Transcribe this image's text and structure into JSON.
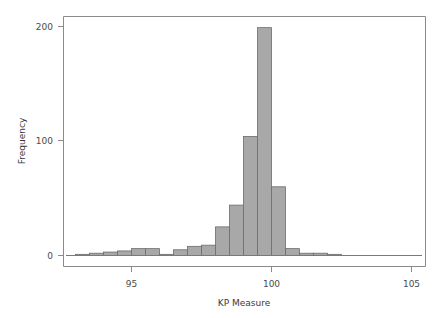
{
  "chart_data": {
    "type": "bar",
    "title": "",
    "subtitle": "",
    "xlabel": "KP Measure",
    "ylabel": "Frequency",
    "xlim": [
      93.0,
      105.5
    ],
    "ylim": [
      0,
      210
    ],
    "xticks": [
      95,
      100,
      105
    ],
    "xtick_labels": [
      "95",
      "100",
      "105"
    ],
    "yticks": [
      0,
      100,
      200
    ],
    "ytick_labels": [
      "0",
      "100",
      "200"
    ],
    "grid": false,
    "legend": null,
    "bin_width": 0.5,
    "bar_color": "#a8a8a8",
    "bar_edge_color": "#6b6b6b",
    "axis_color": "#8a8a8a",
    "text_color": "#4a4a4a",
    "background": "#ffffff",
    "categories": [
      "93.25",
      "93.75",
      "94.25",
      "94.75",
      "95.25",
      "95.75",
      "96.25",
      "96.75",
      "97.25",
      "97.75",
      "98.25",
      "98.75",
      "99.25",
      "99.75",
      "100.25",
      "100.75",
      "101.25",
      "101.75",
      "102.25",
      "102.75"
    ],
    "bins": [
      {
        "x0": 93.0,
        "x1": 93.5,
        "center": 93.25,
        "count": 1
      },
      {
        "x0": 93.5,
        "x1": 94.0,
        "center": 93.75,
        "count": 2
      },
      {
        "x0": 94.0,
        "x1": 94.5,
        "center": 94.25,
        "count": 3
      },
      {
        "x0": 94.5,
        "x1": 95.0,
        "center": 94.75,
        "count": 4
      },
      {
        "x0": 95.0,
        "x1": 95.5,
        "center": 95.25,
        "count": 6
      },
      {
        "x0": 95.5,
        "x1": 96.0,
        "center": 95.75,
        "count": 6
      },
      {
        "x0": 96.0,
        "x1": 96.5,
        "center": 96.25,
        "count": 1
      },
      {
        "x0": 96.5,
        "x1": 97.0,
        "center": 96.75,
        "count": 5
      },
      {
        "x0": 97.0,
        "x1": 97.5,
        "center": 97.25,
        "count": 8
      },
      {
        "x0": 97.5,
        "x1": 98.0,
        "center": 97.75,
        "count": 9
      },
      {
        "x0": 98.0,
        "x1": 98.5,
        "center": 98.25,
        "count": 25
      },
      {
        "x0": 98.5,
        "x1": 99.0,
        "center": 98.75,
        "count": 44
      },
      {
        "x0": 99.0,
        "x1": 99.5,
        "center": 99.25,
        "count": 104
      },
      {
        "x0": 99.5,
        "x1": 100.0,
        "center": 99.75,
        "count": 199
      },
      {
        "x0": 100.0,
        "x1": 100.5,
        "center": 100.25,
        "count": 60
      },
      {
        "x0": 100.5,
        "x1": 101.0,
        "center": 100.75,
        "count": 6
      },
      {
        "x0": 101.0,
        "x1": 101.5,
        "center": 101.25,
        "count": 2
      },
      {
        "x0": 101.5,
        "x1": 102.0,
        "center": 101.75,
        "count": 2
      },
      {
        "x0": 102.0,
        "x1": 102.5,
        "center": 102.25,
        "count": 1
      },
      {
        "x0": 102.5,
        "x1": 103.0,
        "center": 102.75,
        "count": 0
      }
    ],
    "values": [
      1,
      2,
      3,
      4,
      6,
      6,
      1,
      5,
      8,
      9,
      25,
      44,
      104,
      199,
      60,
      6,
      2,
      2,
      1,
      0
    ]
  }
}
